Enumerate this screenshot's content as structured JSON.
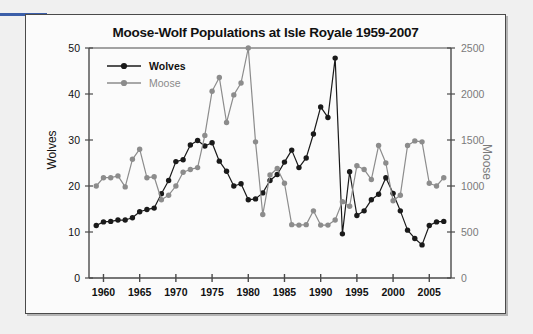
{
  "figure": {
    "title": "Moose-Wolf Populations at Isle Royale 1959-2007",
    "left_axis_label": "Wolves",
    "right_axis_label": "Moose",
    "colors": {
      "wolves": "#1a1a1a",
      "moose": "#8c8c8c",
      "axis": "#4a4a4a",
      "frame": "#4a4a4a",
      "background": "#fbfbfb",
      "page_background": "#f0f0f0",
      "accent_rule": "#3b5ea8"
    }
  },
  "legend": {
    "position": "top-left-inside",
    "entries": [
      {
        "label": "Wolves",
        "color": "#1a1a1a",
        "marker": "filled-circle"
      },
      {
        "label": "Moose",
        "color": "#8c8c8c",
        "marker": "filled-circle"
      }
    ]
  },
  "chart_data": {
    "type": "line",
    "title": "Moose-Wolf Populations at Isle Royale 1959-2007",
    "xlabel": "",
    "ylabel": "Wolves",
    "y2label": "Moose",
    "xlim": [
      1958,
      2008
    ],
    "ylim": [
      0,
      50
    ],
    "y2lim": [
      0,
      2500
    ],
    "grid": false,
    "legend_position": "upper left",
    "xticks": [
      1960,
      1965,
      1970,
      1975,
      1980,
      1985,
      1990,
      1995,
      2000,
      2005
    ],
    "xtick_labels": [
      "1960",
      "1965",
      "1970",
      "1975",
      "1980",
      "1985",
      "1990",
      "1995",
      "2000",
      "2005"
    ],
    "yticks": [
      0,
      10,
      20,
      30,
      40,
      50
    ],
    "ytick_labels": [
      "0",
      "10",
      "20",
      "30",
      "40",
      "50"
    ],
    "y2ticks": [
      0,
      500,
      1000,
      1500,
      2000,
      2500
    ],
    "y2tick_labels": [
      "0",
      "500",
      "1000",
      "1500",
      "2000",
      "2500"
    ],
    "x": [
      1959,
      1960,
      1961,
      1962,
      1963,
      1964,
      1965,
      1966,
      1967,
      1968,
      1969,
      1970,
      1971,
      1972,
      1973,
      1974,
      1975,
      1976,
      1977,
      1978,
      1979,
      1980,
      1981,
      1982,
      1983,
      1984,
      1985,
      1986,
      1987,
      1988,
      1989,
      1990,
      1991,
      1992,
      1993,
      1994,
      1995,
      1996,
      1997,
      1998,
      1999,
      2000,
      2001,
      2002,
      2003,
      2004,
      2005,
      2006,
      2007
    ],
    "series": [
      {
        "name": "Wolves",
        "axis": "left",
        "color": "#1a1a1a",
        "units": "count",
        "values": [
          11.4,
          12.2,
          12.3,
          12.6,
          12.6,
          13.1,
          14.4,
          14.9,
          15.2,
          18.3,
          21.2,
          25.3,
          25.7,
          28.9,
          29.9,
          28.7,
          29.4,
          25.4,
          23.2,
          20.0,
          20.5,
          17.0,
          17.2,
          18.5,
          21.2,
          22.5,
          25.2,
          27.8,
          24.0,
          26.1,
          31.3,
          37.2,
          34.9,
          47.8,
          9.6,
          23.1,
          13.6,
          14.6,
          17.0,
          18.2,
          21.8,
          18.4,
          14.6,
          10.4,
          8.6,
          7.2,
          11.4,
          12.2,
          12.3
        ]
      },
      {
        "name": "Moose",
        "axis": "right",
        "color": "#8c8c8c",
        "units": "count",
        "values": [
          1000,
          1090,
          1090,
          1110,
          990,
          1290,
          1400,
          1090,
          1100,
          850,
          900,
          1000,
          1150,
          1180,
          1200,
          1550,
          2030,
          2180,
          1690,
          1990,
          2120,
          2500,
          1480,
          690,
          1120,
          1190,
          1030,
          580,
          575,
          580,
          730,
          575,
          575,
          630,
          830,
          780,
          1220,
          1180,
          1070,
          1440,
          1250,
          840,
          900,
          1440,
          1490,
          1480,
          1030,
          1000,
          1090
        ]
      }
    ],
    "notes": [
      "Wolves plotted on left axis (0-50), Moose on right axis (0-2500).",
      "Moose peak 2500 in 1980; wolf peak 48 in 1995 followed by crash to ~10.",
      "Wolves decline to ~7 by 2007; Moose end near 1050."
    ]
  }
}
